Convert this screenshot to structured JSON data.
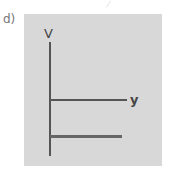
{
  "figure": {
    "label": "d)",
    "vertical_axis_label": "V",
    "horizontal_axis_label": "y"
  }
}
